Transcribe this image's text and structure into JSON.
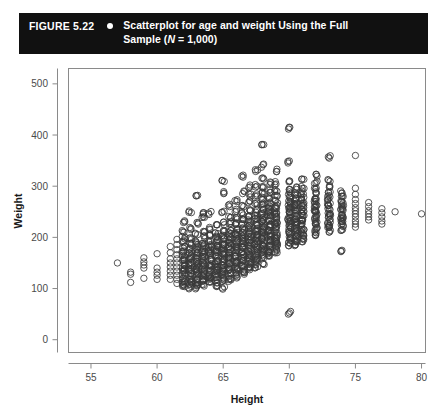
{
  "caption": {
    "figure_number": "FIGURE 5.22",
    "bullet_icon": "bullet-dot-icon",
    "line1": "Scatterplot for age and weight Using the Full",
    "line2_prefix": "Sample (",
    "line2_italic": "N",
    "line2_suffix": " = 1,000)",
    "background_color": "#111111",
    "text_color": "#ffffff"
  },
  "chart_data": {
    "type": "scatter",
    "title": "Scatterplot for age and weight Using the Full Sample (N = 1,000)",
    "xlabel": "Height",
    "ylabel": "Weight",
    "xlim": [
      53.3,
      80.3
    ],
    "ylim": [
      -25,
      530
    ],
    "xticks": [
      55,
      60,
      65,
      70,
      75,
      80
    ],
    "yticks": [
      0,
      100,
      200,
      300,
      400,
      500
    ],
    "xtick_labels": [
      "55",
      "60",
      "65",
      "70",
      "75",
      "80"
    ],
    "ytick_labels": [
      "0",
      "100",
      "200",
      "300",
      "400",
      "500"
    ],
    "grid": false,
    "legend": false,
    "n_points": 1000,
    "marker": "open-circle",
    "marker_color": "#3a3a3a",
    "marker_size": 3.2,
    "columns": [
      {
        "x": 57.0,
        "weights": [
          150
        ]
      },
      {
        "x": 58.0,
        "weights": [
          128,
          132,
          112
        ]
      },
      {
        "x": 59.0,
        "weights": [
          160,
          152,
          146,
          140,
          120
        ]
      },
      {
        "x": 60.0,
        "weights": [
          168,
          140,
          132,
          126,
          118
        ]
      },
      {
        "x": 61.0,
        "weights": [
          182,
          170,
          158,
          150,
          142,
          134,
          126,
          118
        ]
      },
      {
        "x": 61.5,
        "weights": [
          196,
          186,
          176,
          166,
          158,
          150,
          142,
          134,
          126,
          118,
          110
        ]
      },
      {
        "x": 62.0,
        "weights": [
          232,
          212,
          200,
          190,
          182,
          174,
          166,
          158,
          152,
          146,
          140,
          134,
          128,
          122,
          116,
          110,
          104
        ]
      },
      {
        "x": 62.5,
        "weights": [
          250,
          218,
          196,
          186,
          178,
          170,
          162,
          156,
          150,
          144,
          138,
          132,
          126,
          120,
          114,
          108,
          102
        ]
      },
      {
        "x": 63.0,
        "weights": [
          280,
          228,
          206,
          192,
          184,
          176,
          168,
          162,
          156,
          150,
          144,
          138,
          132,
          126,
          120,
          114,
          108,
          102
        ]
      },
      {
        "x": 63.5,
        "weights": [
          248,
          240,
          214,
          200,
          190,
          182,
          174,
          168,
          162,
          156,
          150,
          144,
          138,
          132,
          126,
          120,
          114,
          108
        ]
      },
      {
        "x": 64.0,
        "weights": [
          248,
          218,
          204,
          194,
          186,
          178,
          172,
          166,
          160,
          154,
          148,
          142,
          136,
          130,
          124,
          118,
          112
        ]
      },
      {
        "x": 64.5,
        "weights": [
          222,
          210,
          200,
          192,
          186,
          180,
          174,
          168,
          162,
          156,
          150,
          144,
          138,
          132,
          126,
          120,
          114,
          106
        ]
      },
      {
        "x": 65.0,
        "weights": [
          310,
          288,
          250,
          228,
          214,
          204,
          196,
          188,
          182,
          176,
          170,
          164,
          158,
          152,
          146,
          140,
          134,
          128,
          122,
          116,
          100
        ]
      },
      {
        "x": 65.5,
        "weights": [
          262,
          242,
          228,
          216,
          208,
          200,
          194,
          188,
          182,
          176,
          170,
          164,
          158,
          152,
          146,
          140,
          134,
          128,
          122,
          116
        ]
      },
      {
        "x": 66.0,
        "weights": [
          272,
          252,
          238,
          226,
          216,
          208,
          202,
          196,
          190,
          184,
          178,
          172,
          166,
          160,
          154,
          148,
          142,
          136,
          130,
          124
        ]
      },
      {
        "x": 66.5,
        "weights": [
          320,
          288,
          262,
          246,
          234,
          224,
          216,
          208,
          202,
          196,
          190,
          184,
          178,
          172,
          166,
          160,
          154,
          148,
          142,
          136,
          130
        ]
      },
      {
        "x": 67.0,
        "weights": [
          300,
          282,
          268,
          254,
          242,
          232,
          224,
          216,
          210,
          204,
          198,
          192,
          186,
          180,
          174,
          168,
          162,
          156,
          150,
          144,
          138
        ]
      },
      {
        "x": 67.5,
        "weights": [
          330,
          300,
          282,
          266,
          252,
          242,
          234,
          226,
          220,
          214,
          208,
          202,
          196,
          190,
          184,
          178,
          172,
          166,
          160,
          154,
          148,
          142
        ]
      },
      {
        "x": 68.0,
        "weights": [
          380,
          340,
          316,
          298,
          286,
          276,
          266,
          256,
          248,
          240,
          234,
          228,
          222,
          216,
          210,
          204,
          198,
          192,
          186,
          180,
          174,
          168,
          162,
          150
        ]
      },
      {
        "x": 68.5,
        "weights": [
          306,
          290,
          278,
          268,
          260,
          252,
          246,
          240,
          234,
          228,
          222,
          216,
          210,
          204,
          198,
          192,
          186,
          180,
          174,
          168,
          162
        ]
      },
      {
        "x": 69.0,
        "weights": [
          330,
          306,
          292,
          280,
          270,
          262,
          254,
          248,
          242,
          236,
          230,
          224,
          218,
          212,
          206,
          200,
          194,
          188,
          182,
          176,
          170
        ]
      },
      {
        "x": 70.0,
        "weights": [
          412,
          346,
          310,
          296,
          286,
          278,
          270,
          264,
          258,
          252,
          246,
          240,
          234,
          228,
          222,
          216,
          210,
          204,
          198,
          192,
          186,
          52
        ]
      },
      {
        "x": 70.5,
        "weights": [
          296,
          286,
          276,
          268,
          262,
          256,
          250,
          244,
          238,
          232,
          226,
          220,
          214,
          208,
          202,
          196,
          190,
          184
        ]
      },
      {
        "x": 71.0,
        "weights": [
          312,
          298,
          288,
          280,
          272,
          266,
          260,
          254,
          248,
          242,
          236,
          230,
          224,
          218,
          212,
          206,
          200,
          194
        ]
      },
      {
        "x": 72.0,
        "weights": [
          322,
          308,
          296,
          286,
          278,
          272,
          266,
          260,
          254,
          248,
          242,
          236,
          230,
          224,
          218,
          212,
          206
        ]
      },
      {
        "x": 73.0,
        "weights": [
          358,
          312,
          298,
          288,
          280,
          272,
          266,
          260,
          254,
          248,
          242,
          236,
          230,
          224,
          218,
          212
        ]
      },
      {
        "x": 74.0,
        "weights": [
          288,
          278,
          270,
          264,
          258,
          252,
          246,
          240,
          234,
          228,
          222,
          216,
          172
        ]
      },
      {
        "x": 75.0,
        "weights": [
          360,
          296,
          284,
          274,
          266,
          258,
          252,
          246,
          240,
          232,
          226,
          220
        ]
      },
      {
        "x": 76.0,
        "weights": [
          268,
          260,
          252,
          246,
          240,
          234
        ]
      },
      {
        "x": 77.0,
        "weights": [
          256,
          248,
          240,
          232,
          226
        ]
      },
      {
        "x": 78.0,
        "weights": [
          250
        ]
      },
      {
        "x": 80.0,
        "weights": [
          246
        ]
      }
    ]
  }
}
